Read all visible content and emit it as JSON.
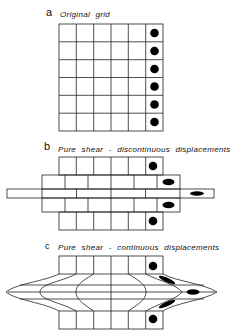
{
  "panels": [
    {
      "letter": "a",
      "title": "Original grid"
    },
    {
      "letter": "b",
      "title": "Pure shear - discontinuous displacements"
    },
    {
      "letter": "c",
      "title": "Pure shear - continuous displacements"
    }
  ],
  "colors": {
    "line": "#222222",
    "marker": "#000000",
    "background": "#ffffff"
  },
  "grid": {
    "columns": 6,
    "rows": 6,
    "marker_column": 6
  }
}
